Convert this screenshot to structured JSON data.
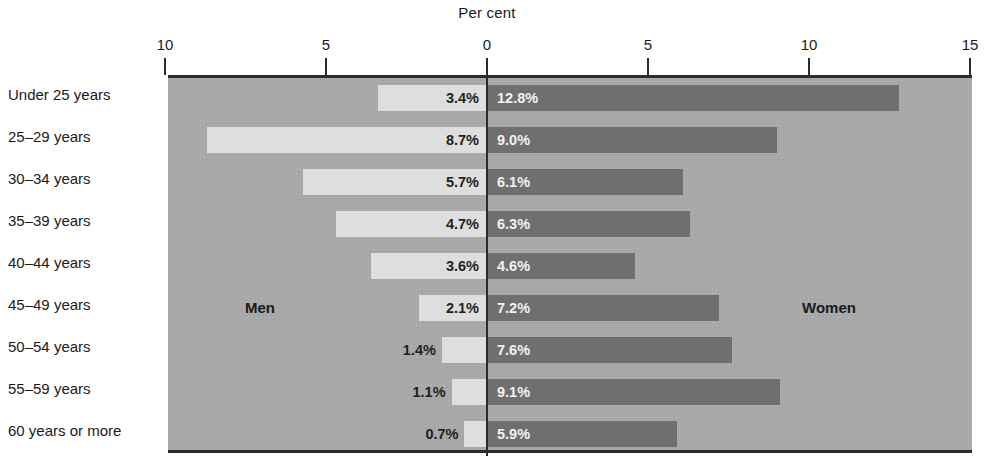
{
  "chart_data": {
    "type": "bar",
    "subtype": "diverging-population-pyramid",
    "title": "Per cent",
    "xlabel": "Per cent",
    "ylabel": "",
    "grid": false,
    "legend_position": "in-plot",
    "axis": {
      "left_max": 10,
      "right_max": 15,
      "tick_labels": [
        "10",
        "5",
        "0",
        "5",
        "10",
        "15"
      ],
      "tick_values": [
        -10,
        -5,
        0,
        5,
        10,
        15
      ]
    },
    "series": [
      {
        "name": "Men",
        "color": "#dedede",
        "side": "left",
        "values": [
          3.4,
          8.7,
          5.7,
          4.7,
          3.6,
          2.1,
          1.4,
          1.1,
          0.7
        ],
        "labels": [
          "3.4%",
          "8.7%",
          "5.7%",
          "4.7%",
          "3.6%",
          "2.1%",
          "1.4%",
          "1.1%",
          "0.7%"
        ]
      },
      {
        "name": "Women",
        "color": "#6f6f6f",
        "side": "right",
        "values": [
          12.8,
          9.0,
          6.1,
          6.3,
          4.6,
          7.2,
          7.6,
          9.1,
          5.9
        ],
        "labels": [
          "12.8%",
          "9.0%",
          "6.1%",
          "6.3%",
          "4.6%",
          "7.2%",
          "7.6%",
          "9.1%",
          "5.9%"
        ]
      }
    ],
    "categories": [
      "Under 25 years",
      "25–29 years",
      "30–34 years",
      "35–39 years",
      "40–44 years",
      "45–49 years",
      "50–54 years",
      "55–59 years",
      "60 years or more"
    ]
  },
  "annotations": {
    "men_label": "Men",
    "women_label": "Women"
  },
  "colors": {
    "plot_background": "#a9a9a9",
    "men_bar": "#dedede",
    "women_bar": "#6f6f6f",
    "axis": "#2b2b2b",
    "page_background": "#ffffff"
  }
}
